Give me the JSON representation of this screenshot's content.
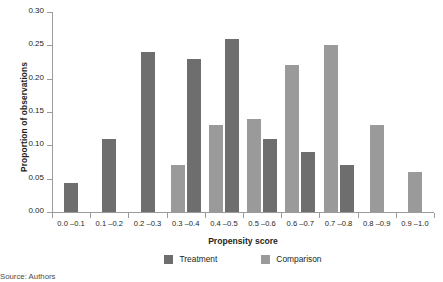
{
  "figure": {
    "source_note": "Source: Authors"
  },
  "chart_data": {
    "type": "bar",
    "title": "",
    "xlabel": "Propensity score",
    "ylabel": "Proportion of observations",
    "categories": [
      "0.0 –0.1",
      "0.1 –0.2",
      "0.2 –0.3",
      "0.3 –0.4",
      "0.4 –0.5",
      "0.5 –0.6",
      "0.6 –0.7",
      "0.7 –0.8",
      "0.8 –0.9",
      "0.9 –1.0"
    ],
    "series": [
      {
        "name": "Treatment",
        "color": "#6e6e6e",
        "values": [
          0.043,
          0.11,
          0.24,
          0.23,
          0.26,
          0.11,
          0.09,
          0.07,
          0.0,
          0.0
        ]
      },
      {
        "name": "Comparison",
        "color": "#9a9a9a",
        "values": [
          0.0,
          0.0,
          0.0,
          0.07,
          0.13,
          0.14,
          0.22,
          0.25,
          0.13,
          0.06
        ]
      }
    ],
    "ylim": [
      0.0,
      0.3
    ],
    "yticks": [
      0.0,
      0.05,
      0.1,
      0.15,
      0.2,
      0.25,
      0.3
    ],
    "ytick_labels": [
      "0.00",
      "0.05",
      "0.10",
      "0.15",
      "0.20",
      "0.25",
      "0.30"
    ],
    "grid": false,
    "legend_position": "bottom"
  }
}
